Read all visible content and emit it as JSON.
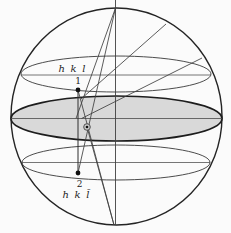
{
  "figure": {
    "background": "#fbfbfb",
    "ink": "#2b2b2b",
    "thin_ink": "#3f3f3f",
    "equator_fill": "#d9d9d9",
    "labels": {
      "upper_reflection": "h k l",
      "upper_point": "1",
      "lower_point": "2",
      "lower_reflection": "h k l̄"
    }
  }
}
